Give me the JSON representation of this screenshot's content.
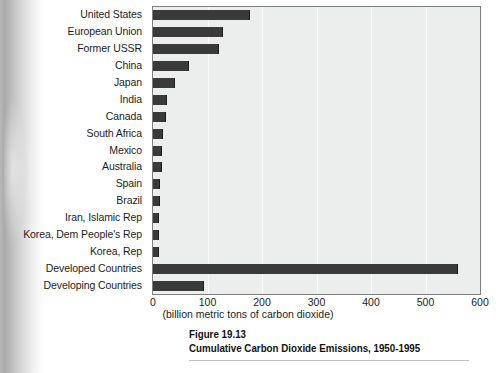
{
  "caption": {
    "figure_number": "Figure 19.13",
    "title": "Cumulative Carbon Dioxide Emissions, 1950-1995"
  },
  "chart_data": {
    "type": "bar",
    "orientation": "horizontal",
    "title": "Cumulative Carbon Dioxide Emissions, 1950-1995",
    "xlabel": "(billion metric tons of carbon dioxide)",
    "ylabel": "",
    "xlim": [
      0,
      600
    ],
    "xticks": [
      0,
      100,
      200,
      300,
      400,
      500,
      600
    ],
    "grid": true,
    "legend": "none",
    "bar_color": "#3a3a3a",
    "plot_background": "#eceded",
    "categories": [
      "United States",
      "European Union",
      "Former USSR",
      "China",
      "Japan",
      "India",
      "Canada",
      "South Africa",
      "Mexico",
      "Australia",
      "Spain",
      "Brazil",
      "Iran, Islamic Rep",
      "Korea, Dem People's Rep",
      "Korea, Rep",
      "Developed Countries",
      "Developing Countries"
    ],
    "values": [
      176,
      127,
      120,
      64,
      38,
      23,
      22,
      16,
      15,
      14,
      11,
      11,
      10,
      10,
      10,
      557,
      91
    ]
  },
  "axis": {
    "tick_labels": [
      "0",
      "100",
      "200",
      "300",
      "400",
      "500",
      "600"
    ],
    "x_title": "(billion metric tons of carbon dioxide)"
  }
}
